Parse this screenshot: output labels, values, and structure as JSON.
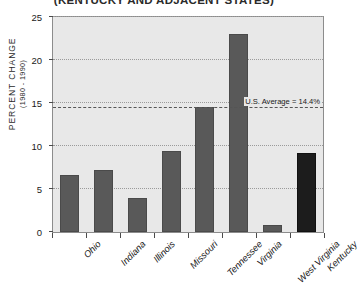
{
  "chart_data": {
    "type": "bar",
    "title": "(KENTUCKY AND ADJACENT STATES)",
    "xlabel": "",
    "ylabel": "PERCENT CHANGE",
    "ylabel_sub": "(1980 - 1990)",
    "ylim": [
      0,
      25
    ],
    "yticks": [
      0,
      5,
      10,
      15,
      20,
      25
    ],
    "ytick_labels": [
      "0",
      "5",
      "10",
      "15",
      "20",
      "25"
    ],
    "grid": true,
    "legend": "none",
    "categories": [
      "Ohio",
      "Indiana",
      "Illinois",
      "Missouri",
      "Tennessee",
      "Virginia",
      "West Virginia",
      "Kentucky"
    ],
    "values": [
      6.6,
      7.2,
      4.0,
      9.4,
      14.5,
      23.0,
      0.8,
      9.2
    ],
    "highlight_category": "Kentucky",
    "annotations": [
      {
        "label": "U.S. Average = 14.4%",
        "value": 14.4,
        "style": "dashed-horizontal-line"
      }
    ],
    "colors": {
      "bar": "#595959",
      "bar_highlight": "#1c1c1c",
      "plot_background": "#e8e8e8",
      "grid": "#9a9a9a",
      "axis": "#4a4a4a",
      "text": "#1a1a1a",
      "page_background": "#ffffff"
    }
  }
}
